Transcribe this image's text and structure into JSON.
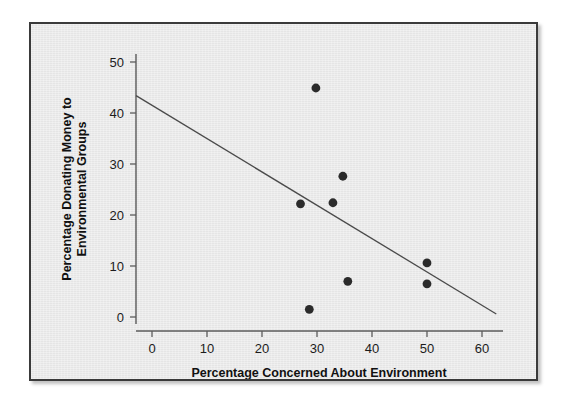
{
  "figure": {
    "background_color": "#ffffff",
    "panel_color": "#ebebeb",
    "border_color": "#3a3a3a"
  },
  "chart_data": {
    "type": "scatter",
    "title": "",
    "xlabel": "Percentage Concerned About Environment",
    "ylabel": "Percentage Donating Money to Environmental Groups",
    "ylabel_line1": "Percentage Donating Money to",
    "ylabel_line2": "Environmental Groups",
    "xlim": [
      -3.5,
      64
    ],
    "ylim": [
      -2.5,
      52
    ],
    "xticks": [
      0,
      10,
      20,
      30,
      40,
      50,
      60
    ],
    "yticks": [
      0,
      10,
      20,
      30,
      40,
      50
    ],
    "xtick_labels": [
      "0",
      "10",
      "20",
      "30",
      "40",
      "50",
      "60"
    ],
    "ytick_labels": [
      "0",
      "10",
      "20",
      "30",
      "40",
      "50"
    ],
    "grid": false,
    "legend": false,
    "marker_color": "#2b2b2b",
    "marker_size": 4.4,
    "points": [
      {
        "x": 29.8,
        "y": 44.9
      },
      {
        "x": 34.7,
        "y": 27.6
      },
      {
        "x": 32.9,
        "y": 22.4
      },
      {
        "x": 27.0,
        "y": 22.2
      },
      {
        "x": 50.0,
        "y": 10.6
      },
      {
        "x": 35.6,
        "y": 7.0
      },
      {
        "x": 50.0,
        "y": 6.5
      },
      {
        "x": 28.6,
        "y": 1.5
      }
    ],
    "trendline": {
      "name": "linear fit",
      "color": "#4a4a4a",
      "x_start": -2.9,
      "y_start": 43.4,
      "x_end": 62.6,
      "y_end": 0.6,
      "slope": -0.654,
      "intercept": 41.5
    }
  }
}
